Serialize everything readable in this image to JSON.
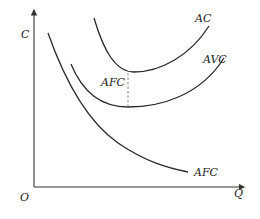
{
  "diagram": {
    "axes": {
      "y_label": "C",
      "x_label": "Q",
      "origin_label": "O"
    },
    "curves": [
      {
        "id": "ac",
        "label": "AC"
      },
      {
        "id": "avc",
        "label": "AVC"
      },
      {
        "id": "afc",
        "label": "AFC"
      }
    ],
    "annotation": {
      "label": "AFC",
      "description": "vertical dashed gap between AC and AVC equals AFC"
    },
    "colors": {
      "line": "#2a2a2a",
      "dashed": "#888888",
      "background": "#ffffff"
    }
  }
}
